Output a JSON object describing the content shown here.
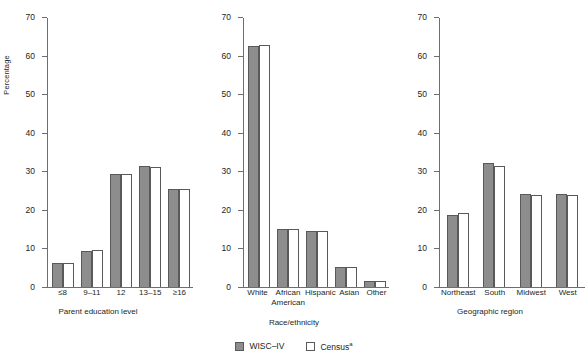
{
  "chart_data": {
    "type": "bar",
    "title": "",
    "ylabel": "Percentage",
    "ylim": [
      0,
      70
    ],
    "yticks": [
      0,
      10,
      20,
      30,
      40,
      50,
      60,
      70
    ],
    "grid": false,
    "legend_position": "bottom-center",
    "series_names": [
      "WISC–IV",
      "Census"
    ],
    "panels": [
      {
        "xlabel": "Parent education level",
        "categories": [
          "≤8",
          "9–11",
          "12",
          "13–15",
          "≥16"
        ],
        "series": [
          {
            "name": "WISC–IV",
            "values": [
              6.2,
              9.3,
              29.2,
              31.3,
              25.4
            ]
          },
          {
            "name": "Census",
            "values": [
              6.2,
              9.7,
              29.2,
              31.0,
              25.5
            ]
          }
        ]
      },
      {
        "xlabel": "Race/ethnicity",
        "categories": [
          "White",
          "African American",
          "Hispanic",
          "Asian",
          "Other"
        ],
        "category_lines": [
          [
            "White"
          ],
          [
            "African",
            "American"
          ],
          [
            "Hispanic"
          ],
          [
            "Asian"
          ],
          [
            "Other"
          ]
        ],
        "series": [
          {
            "name": "WISC–IV",
            "values": [
              62.5,
              15.1,
              14.5,
              5.2,
              1.5
            ]
          },
          {
            "name": "Census",
            "values": [
              62.8,
              15.1,
              14.5,
              5.2,
              1.5
            ]
          }
        ]
      },
      {
        "xlabel": "Geographic region",
        "categories": [
          "Northeast",
          "South",
          "Midwest",
          "West"
        ],
        "series": [
          {
            "name": "WISC–IV",
            "values": [
              18.8,
              32.1,
              24.1,
              24.1
            ]
          },
          {
            "name": "Census",
            "values": [
              19.3,
              31.5,
              23.8,
              23.8
            ]
          }
        ]
      }
    ]
  },
  "axis": {
    "ylabel": "Percentage",
    "yticks": [
      "0",
      "10",
      "20",
      "30",
      "40",
      "50",
      "60",
      "70"
    ]
  },
  "panel0": {
    "xtitle": "Parent education level",
    "cats": [
      "≤8",
      "9–11",
      "12",
      "13–15",
      "≥16"
    ]
  },
  "panel1": {
    "xtitle": "Race/ethnicity",
    "cats_line1": [
      "White",
      "African",
      "Hispanic",
      "Asian",
      "Other"
    ],
    "cats_line2": [
      "",
      "American",
      "",
      "",
      ""
    ]
  },
  "panel2": {
    "xtitle": "Geographic region",
    "cats": [
      "Northeast",
      "South",
      "Midwest",
      "West"
    ]
  },
  "legend": {
    "wisc_label": "WISC–IV",
    "census_label": "Census",
    "census_superscript": "a"
  },
  "colors": {
    "wisc_fill": "#8d8d8d",
    "census_fill": "#ffffff",
    "bar_stroke": "#58595b",
    "axis": "#6d6e71",
    "text": "#231f20"
  }
}
